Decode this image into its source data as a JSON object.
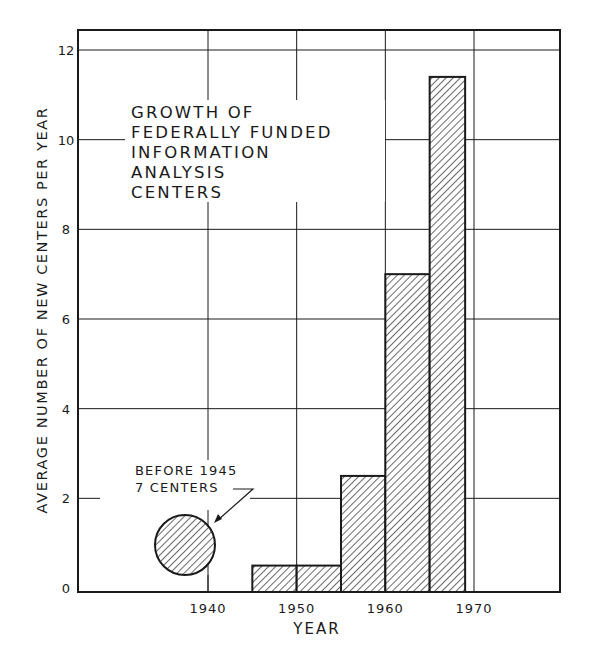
{
  "chart_data": {
    "type": "bar",
    "title_lines": [
      "GROWTH OF",
      "FEDERALLY FUNDED",
      "INFORMATION",
      "ANALYSIS",
      "CENTERS"
    ],
    "xlabel": "YEAR",
    "ylabel": "AVERAGE NUMBER OF NEW CENTERS PER YEAR",
    "xlim": [
      1930,
      1980
    ],
    "ylim": [
      0,
      12
    ],
    "x_ticks": [
      1940,
      1950,
      1960,
      1970
    ],
    "y_ticks": [
      0,
      2,
      4,
      6,
      8,
      10,
      12
    ],
    "grid": true,
    "bars": [
      {
        "x_start": 1945,
        "x_end": 1950,
        "value": 0.5
      },
      {
        "x_start": 1950,
        "x_end": 1955,
        "value": 0.5
      },
      {
        "x_start": 1955,
        "x_end": 1960,
        "value": 2.5
      },
      {
        "x_start": 1960,
        "x_end": 1965,
        "value": 7.0
      },
      {
        "x_start": 1965,
        "x_end": 1969,
        "value": 11.4
      }
    ],
    "categories": [
      "1945-1950",
      "1950-1955",
      "1955-1960",
      "1960-1965",
      "1965-1969"
    ],
    "values": [
      0.5,
      0.5,
      2.5,
      7.0,
      11.4
    ],
    "annotations": [
      {
        "text_lines": [
          "BEFORE 1945",
          "7 CENTERS"
        ],
        "marker": "hatched-circle",
        "x": 1937,
        "y": 1.0
      }
    ],
    "fill": "diagonal-hatch",
    "colors": {
      "ink": "#1a1a1a",
      "background": "#ffffff"
    }
  }
}
